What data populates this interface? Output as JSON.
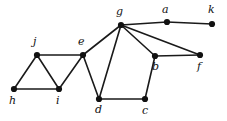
{
  "figure": {
    "width": 227,
    "height": 121,
    "background_color": "#ffffff",
    "edge_color": "#1a1a1a",
    "vertex_color": "#111111",
    "label_color": "#111111",
    "edge_width": 1.6,
    "vertex_radius": 3.1
  },
  "graph_data": {
    "type": "node-link-diagram",
    "directed": false,
    "vertex_count": 11,
    "edge_count": 15,
    "vertices": [
      {
        "id": "g",
        "label": "g",
        "x": 121,
        "y": 25,
        "label_x": 116,
        "label_y": 6,
        "label_anchor": "above-left"
      },
      {
        "id": "a",
        "label": "a",
        "x": 167,
        "y": 22,
        "label_x": 162,
        "label_y": 4,
        "label_anchor": "above-left"
      },
      {
        "id": "k",
        "label": "k",
        "x": 212,
        "y": 24,
        "label_x": 208,
        "label_y": 4,
        "label_anchor": "above-left"
      },
      {
        "id": "j",
        "label": "j",
        "x": 37,
        "y": 55,
        "label_x": 33,
        "label_y": 36,
        "label_anchor": "above-left"
      },
      {
        "id": "e",
        "label": "e",
        "x": 83,
        "y": 55,
        "label_x": 78,
        "label_y": 36,
        "label_anchor": "above-left"
      },
      {
        "id": "b",
        "label": "b",
        "x": 155,
        "y": 56,
        "label_x": 152,
        "label_y": 61,
        "label_anchor": "below-left"
      },
      {
        "id": "f",
        "label": "f",
        "x": 200,
        "y": 55,
        "label_x": 197,
        "label_y": 61,
        "label_anchor": "below-left"
      },
      {
        "id": "h",
        "label": "h",
        "x": 14,
        "y": 89,
        "label_x": 9,
        "label_y": 95,
        "label_anchor": "below-left"
      },
      {
        "id": "i",
        "label": "i",
        "x": 59,
        "y": 89,
        "label_x": 56,
        "label_y": 95,
        "label_anchor": "below-left"
      },
      {
        "id": "d",
        "label": "d",
        "x": 99,
        "y": 99,
        "label_x": 95,
        "label_y": 104,
        "label_anchor": "below-left"
      },
      {
        "id": "c",
        "label": "c",
        "x": 145,
        "y": 99,
        "label_x": 142,
        "label_y": 105,
        "label_anchor": "below-left"
      }
    ],
    "edges": [
      {
        "source": "h",
        "target": "j"
      },
      {
        "source": "h",
        "target": "i"
      },
      {
        "source": "j",
        "target": "i"
      },
      {
        "source": "j",
        "target": "e"
      },
      {
        "source": "i",
        "target": "e"
      },
      {
        "source": "e",
        "target": "g"
      },
      {
        "source": "e",
        "target": "d"
      },
      {
        "source": "d",
        "target": "g"
      },
      {
        "source": "d",
        "target": "c"
      },
      {
        "source": "c",
        "target": "b"
      },
      {
        "source": "b",
        "target": "g"
      },
      {
        "source": "b",
        "target": "f"
      },
      {
        "source": "g",
        "target": "f"
      },
      {
        "source": "g",
        "target": "a"
      },
      {
        "source": "a",
        "target": "k"
      }
    ]
  }
}
